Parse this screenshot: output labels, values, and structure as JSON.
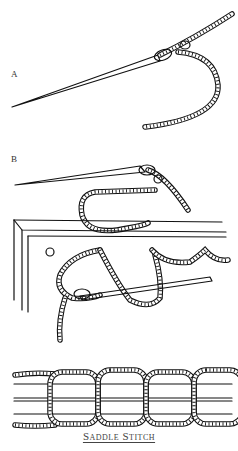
{
  "figure": {
    "labels": {
      "a": "A",
      "b": "B"
    },
    "caption": "Saddle Stitch",
    "colors": {
      "ink": "#111111",
      "background": "#ffffff",
      "caption": "#444444"
    },
    "panels": [
      {
        "id": "A",
        "description": "Needle threaded with twisted rope, thread looped through the eye"
      },
      {
        "id": "B",
        "description": "Needle passing through holes in two layered pieces of leather, with rope stitch"
      },
      {
        "id": "result",
        "description": "Finished saddle stitch: interlocking rope loops over parallel lines"
      }
    ]
  }
}
